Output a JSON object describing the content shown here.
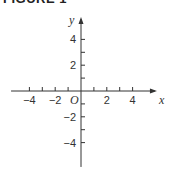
{
  "title": "FIGURE 1",
  "chart_data": {
    "type": "scatter",
    "title": "FIGURE 1",
    "xlabel": "x",
    "ylabel": "y",
    "xlim": [
      -5.5,
      5.5
    ],
    "ylim": [
      -5.5,
      5.5
    ],
    "x_ticks": [
      -4,
      -3,
      -2,
      -1,
      1,
      2,
      3,
      4
    ],
    "y_ticks": [
      -4,
      -3,
      -2,
      -1,
      1,
      2,
      3,
      4
    ],
    "x_tick_labels": [
      "-4",
      "-2",
      "2",
      "4"
    ],
    "x_tick_label_values": [
      -4,
      -2,
      2,
      4
    ],
    "y_tick_labels": [
      "4",
      "2",
      "-2",
      "-4"
    ],
    "y_tick_label_values": [
      4,
      2,
      -2,
      -4
    ],
    "origin_label": "O",
    "grid": false,
    "points": []
  }
}
